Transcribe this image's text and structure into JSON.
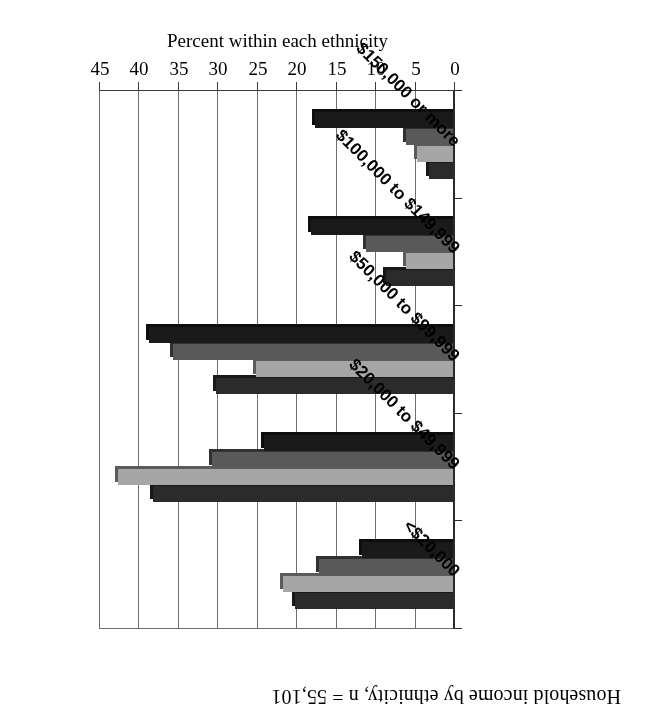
{
  "title": "Household income by ethnicity, n = 55,101",
  "axis_title_value": "Percent within each ethnicity",
  "chart_data": {
    "type": "bar",
    "orientation": "horizontal",
    "title": "Household income by ethnicity, n = 55,101",
    "xlabel": "Percent within each ethnicity",
    "ylabel": "",
    "categories": [
      "<$20,000",
      "$20,000 to $49,999",
      "$50,000 to $99,999",
      "$100,000 to $149,999",
      "$150,000 or more"
    ],
    "series": [
      {
        "name": "series-1",
        "color": "#2b2b2b",
        "values": [
          20.0,
          38.0,
          30.0,
          8.5,
          3.0
        ]
      },
      {
        "name": "series-2",
        "color": "#a6a6a6",
        "values": [
          21.5,
          42.5,
          25.0,
          6.0,
          4.5
        ]
      },
      {
        "name": "series-3",
        "color": "#595959",
        "values": [
          17.0,
          30.5,
          35.5,
          11.0,
          6.0
        ]
      },
      {
        "name": "series-4",
        "color": "#1a1a1a",
        "values": [
          11.5,
          24.0,
          38.5,
          18.0,
          17.5
        ]
      }
    ],
    "value_ticks": [
      0,
      5,
      10,
      15,
      20,
      25,
      30,
      35,
      40,
      45
    ],
    "xlim": [
      0,
      45
    ],
    "grid": true,
    "legend": "none",
    "tick_labels": [
      "0",
      "5",
      "10",
      "15",
      "20",
      "25",
      "30",
      "35",
      "40",
      "45"
    ]
  },
  "colors": {
    "series_1": "#2b2b2b",
    "series_2": "#a6a6a6",
    "series_3": "#595959",
    "series_4": "#1a1a1a",
    "gridline": "#6e6e6e",
    "axis": "#2b2b2b",
    "background": "#ffffff"
  },
  "rotation_note": "180"
}
